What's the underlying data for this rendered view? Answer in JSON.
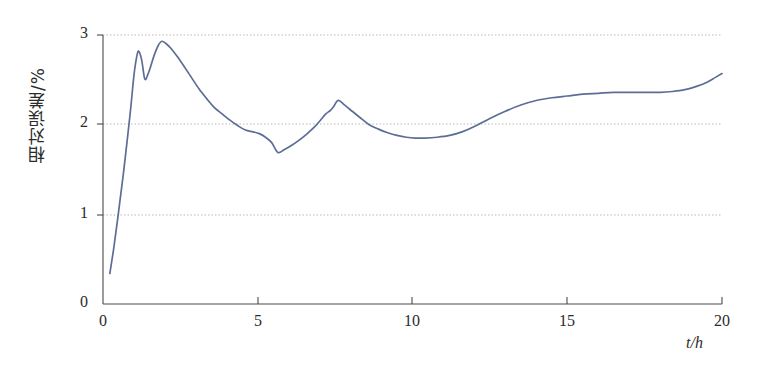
{
  "chart_data": {
    "type": "line",
    "title": "",
    "xlabel": "t/h",
    "ylabel": "相对误差/%",
    "xlim": [
      0,
      20
    ],
    "ylim": [
      0,
      3
    ],
    "xticks": [
      0,
      5,
      10,
      15,
      20
    ],
    "yticks": [
      0,
      1,
      2,
      3
    ],
    "xtick_labels": [
      "0",
      "5",
      "10",
      "15",
      "20"
    ],
    "ytick_labels": [
      "0",
      "1",
      "2",
      "3"
    ],
    "grid": "horizontal-dotted",
    "legend": "none",
    "series": [
      {
        "name": "相对误差",
        "color": "#5d6d96",
        "x": [
          0.22,
          0.35,
          0.5,
          0.65,
          0.8,
          0.9,
          1.0,
          1.08,
          1.15,
          1.25,
          1.35,
          1.45,
          1.55,
          1.65,
          1.78,
          1.9,
          2.05,
          2.2,
          2.4,
          2.6,
          2.85,
          3.1,
          3.35,
          3.6,
          3.85,
          4.1,
          4.35,
          4.6,
          4.85,
          5.05,
          5.25,
          5.45,
          5.65,
          5.85,
          6.1,
          6.35,
          6.6,
          6.85,
          7.05,
          7.2,
          7.35,
          7.45,
          7.6,
          7.8,
          8.05,
          8.3,
          8.6,
          8.9,
          9.2,
          9.5,
          9.8,
          10.1,
          10.4,
          10.8,
          11.2,
          11.6,
          12.0,
          12.5,
          13.0,
          13.5,
          14.0,
          14.5,
          15.0,
          15.5,
          16.0,
          16.5,
          17.0,
          17.5,
          18.0,
          18.4,
          18.8,
          19.2,
          19.5,
          19.8,
          20.0
        ],
        "y": [
          0.34,
          0.63,
          1.02,
          1.43,
          1.88,
          2.2,
          2.55,
          2.74,
          2.82,
          2.72,
          2.51,
          2.56,
          2.66,
          2.77,
          2.88,
          2.93,
          2.9,
          2.85,
          2.76,
          2.66,
          2.53,
          2.4,
          2.29,
          2.19,
          2.12,
          2.05,
          1.99,
          1.94,
          1.92,
          1.9,
          1.86,
          1.8,
          1.69,
          1.72,
          1.77,
          1.83,
          1.9,
          1.98,
          2.06,
          2.12,
          2.16,
          2.2,
          2.27,
          2.22,
          2.15,
          2.08,
          2.0,
          1.95,
          1.91,
          1.88,
          1.86,
          1.85,
          1.85,
          1.86,
          1.88,
          1.92,
          1.98,
          2.07,
          2.15,
          2.22,
          2.27,
          2.3,
          2.32,
          2.34,
          2.35,
          2.36,
          2.36,
          2.36,
          2.36,
          2.37,
          2.39,
          2.43,
          2.47,
          2.53,
          2.57
        ]
      }
    ]
  },
  "style": {
    "axis_color": "#4a4a4a",
    "grid_color": "#b9b9b9",
    "curve_color": "#5d6d96",
    "background": "#ffffff"
  }
}
